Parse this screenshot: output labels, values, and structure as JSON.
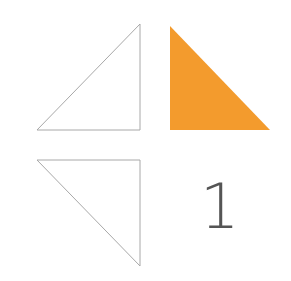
{
  "shapes": [
    {
      "name": "top-left-triangle",
      "fill": "none",
      "stroke": "#a8a8a8",
      "points": "37,130 140,130 140,24"
    },
    {
      "name": "top-right-triangle",
      "fill": "#f39b2d",
      "stroke": "none",
      "points": "170,26 170,130 270,130"
    },
    {
      "name": "bottom-left-triangle",
      "fill": "none",
      "stroke": "#a8a8a8",
      "points": "37,160 140,160 140,266"
    }
  ],
  "label": {
    "text": "1",
    "color": "#555555"
  },
  "colors": {
    "accent": "#f39b2d",
    "outline": "#a8a8a8"
  }
}
